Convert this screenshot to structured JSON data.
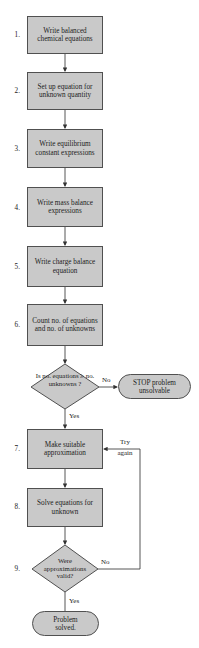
{
  "diagram": {
    "type": "flowchart",
    "colors": {
      "fill": "#c9c9c9",
      "stroke": "#505050",
      "line": "#444444"
    },
    "steps": [
      {
        "num": "1.",
        "label": "Write balanced chemical equations"
      },
      {
        "num": "2.",
        "label": "Set up equation for unknown quantity"
      },
      {
        "num": "3.",
        "label": "Write equilibrium constant expressions"
      },
      {
        "num": "4.",
        "label": "Write mass balance expressions"
      },
      {
        "num": "5.",
        "label": "Write charge balance equation"
      },
      {
        "num": "6.",
        "label": "Count no. of equations and no. of unknowns"
      },
      {
        "num": "7.",
        "label": "Make suitable approximation"
      },
      {
        "num": "8.",
        "label": "Solve equations for unknown"
      }
    ],
    "decisions": [
      {
        "num": "",
        "label": "Is no. equations ≥ no. unknowns ?",
        "yes": "Yes",
        "no": "No"
      },
      {
        "num": "9.",
        "label": "Were approximations valid?",
        "yes": "Yes",
        "no": "No"
      }
    ],
    "terminals": {
      "stop": "STOP problem unsolvable",
      "solved": "Problem solved."
    },
    "loop_label": "Try again"
  }
}
